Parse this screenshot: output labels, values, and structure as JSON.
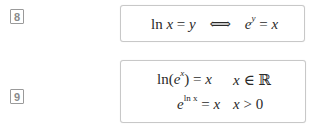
{
  "equations": [
    {
      "number": "8",
      "content": {
        "lhs_fn": "ln",
        "lhs_var": "x",
        "eq": "=",
        "rhs_var": "y",
        "arrow": "⟺",
        "exp_base": "e",
        "exp_sup": "y",
        "eq2": "=",
        "rhs2": "x"
      }
    },
    {
      "number": "9",
      "rows": [
        {
          "left_pre": "ln(",
          "base": "e",
          "sup": "x",
          "left_post": ")",
          "eq": "=",
          "rhs": "x",
          "cond_var": "x",
          "cond_op": "∈",
          "cond_val": "ℝ"
        },
        {
          "base": "e",
          "sup": "ln x",
          "eq": "=",
          "rhs": "x",
          "cond_var": "x",
          "cond_op": ">",
          "cond_val": "0"
        }
      ]
    }
  ]
}
